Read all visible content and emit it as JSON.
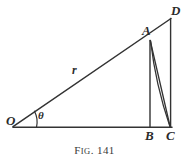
{
  "figure": {
    "caption": {
      "prefix_cap": "F",
      "prefix_small": "IG",
      "separator": ". ",
      "number": "141",
      "full_text": "Fig. 141"
    },
    "colors": {
      "background": "#ffffff",
      "stroke": "#333333",
      "label": "#2b2b2b",
      "caption": "#3a3a3a"
    },
    "points": [
      {
        "id": "O",
        "label": "O",
        "x": 13,
        "y": 127
      },
      {
        "id": "A",
        "label": "A",
        "x": 150,
        "y": 40
      },
      {
        "id": "B",
        "label": "B",
        "x": 150,
        "y": 127
      },
      {
        "id": "C",
        "label": "C",
        "x": 170,
        "y": 127
      },
      {
        "id": "D",
        "label": "D",
        "x": 171,
        "y": 18
      }
    ],
    "segments": [
      {
        "id": "baseline-OC",
        "from": "O",
        "to": "C",
        "kind": "line"
      },
      {
        "id": "ray-OD",
        "from": "O",
        "to": "D",
        "kind": "line"
      },
      {
        "id": "vertical-AB",
        "from": "A",
        "to": "B",
        "kind": "line"
      },
      {
        "id": "vertical-DC",
        "from": "D",
        "to": "C",
        "kind": "line"
      },
      {
        "id": "chord-AC",
        "from": "A",
        "to": "C",
        "kind": "line"
      },
      {
        "id": "arc-AC",
        "from": "A",
        "to": "C",
        "kind": "arc"
      }
    ],
    "angle": {
      "id": "theta-at-O",
      "symbol": "θ",
      "vertex": "O",
      "between": [
        "baseline-OC",
        "ray-OD"
      ],
      "arc_radius": 22
    },
    "length_labels": [
      {
        "id": "radius-r",
        "symbol": "r",
        "on_segment": "ray-OD",
        "x": 75,
        "y": 70
      }
    ]
  }
}
